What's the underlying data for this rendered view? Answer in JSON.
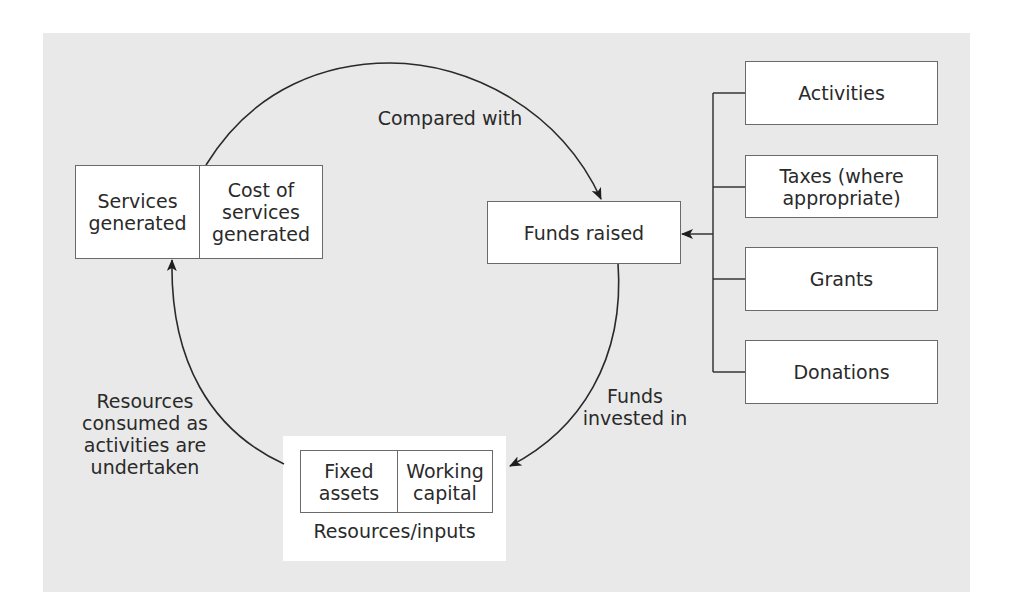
{
  "diagram": {
    "cycle_nodes": {
      "services": {
        "left_cell": "Services\ngenerated",
        "right_cell": "Cost of\nservices\ngenerated"
      },
      "funds_raised": "Funds raised",
      "resources": {
        "left_cell": "Fixed\nassets",
        "right_cell": "Working\ncapital",
        "caption": "Resources/inputs"
      }
    },
    "sources": [
      {
        "label": "Activities"
      },
      {
        "label": "Taxes (where\nappropriate)"
      },
      {
        "label": "Grants"
      },
      {
        "label": "Donations"
      }
    ],
    "edges": [
      {
        "from": "Services generated / Cost of services generated",
        "to": "Funds raised",
        "label": "Compared with"
      },
      {
        "from": "Funds raised",
        "to": "Resources/inputs",
        "label": "Funds\ninvested in"
      },
      {
        "from": "Resources/inputs",
        "to": "Services generated / Cost of services generated",
        "label": "Resources\nconsumed as\nactivities are\nundertaken"
      },
      {
        "from": "Sources (Activities, Taxes, Grants, Donations)",
        "to": "Funds raised",
        "label": ""
      }
    ],
    "colors": {
      "panel_background": "#e9e9e9",
      "box_fill": "#ffffff",
      "stroke": "#2a2a2a"
    }
  }
}
